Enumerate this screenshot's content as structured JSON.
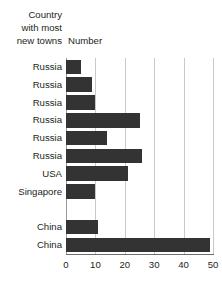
{
  "chart_data": {
    "type": "bar",
    "orientation": "horizontal",
    "title": "",
    "xlabel": "",
    "ylabel": "",
    "column_headers": {
      "category": "Country\nwith most\nnew towns",
      "value": "Number"
    },
    "categories": [
      "Russia",
      "Russia",
      "Russia",
      "Russia",
      "Russia",
      "Russia",
      "USA",
      "Singapore",
      "",
      "China",
      "China"
    ],
    "values": [
      5,
      9,
      10,
      25,
      14,
      26,
      21,
      10,
      null,
      11,
      49
    ],
    "xlim": [
      0,
      50
    ],
    "xticks": [
      0,
      10,
      20,
      30,
      40,
      50
    ],
    "xtick_labels": [
      "0",
      "10",
      "20",
      "30",
      "40",
      "50"
    ],
    "grid": true,
    "grid_axis": "x",
    "legend": false,
    "bar_color": "#333333",
    "gridline_color": "#c9c9c9",
    "axis_color": "#6d6d6d",
    "background_color": "#ffffff"
  }
}
